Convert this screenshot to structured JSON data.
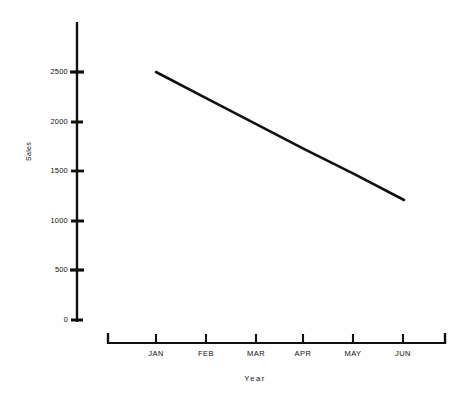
{
  "chart_data": {
    "type": "line",
    "title": "",
    "xlabel": "Year",
    "ylabel": "Sales",
    "categories": [
      "JAN",
      "FEB",
      "MAR",
      "APR",
      "MAY",
      "JUN"
    ],
    "series": [
      {
        "name": "Sales",
        "values": [
          2500,
          2240,
          1980,
          1720,
          1470,
          1210
        ]
      }
    ],
    "ytick_labels": [
      "0",
      "500",
      "1000",
      "1500",
      "2000",
      "2500"
    ],
    "ytick_values": [
      0,
      500,
      1000,
      1500,
      2000,
      2500
    ],
    "ylim": [
      0,
      2900
    ],
    "xlim": [
      0,
      7
    ],
    "grid": false,
    "legend": false,
    "line_color": "#111111",
    "axis_color": "#111111",
    "background_color": "#fefefe"
  },
  "axes": {
    "y_title": "Sales",
    "x_title": "Year",
    "y_ticks": [
      {
        "label": "2500",
        "value": 2500
      },
      {
        "label": "2000",
        "value": 2000
      },
      {
        "label": "1500",
        "value": 1500
      },
      {
        "label": "1000",
        "value": 1000
      },
      {
        "label": "500",
        "value": 500
      },
      {
        "label": "0",
        "value": 0
      }
    ],
    "x_ticks": [
      {
        "label": "JAN"
      },
      {
        "label": "FEB"
      },
      {
        "label": "MAR"
      },
      {
        "label": "APR"
      },
      {
        "label": "MAY"
      },
      {
        "label": "JUN"
      }
    ]
  }
}
